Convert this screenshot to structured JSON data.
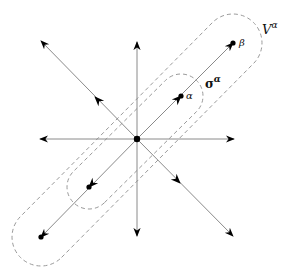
{
  "diagram": {
    "colors": {
      "axis": "#8a8a8a",
      "arrowhead": "#000000",
      "dashed": "#9a9a9a",
      "point": "#000000",
      "text": "#111111"
    },
    "center": {
      "x": 137,
      "y": 139
    },
    "rays": [
      {
        "name": "ray-up",
        "tip": {
          "x": 137,
          "y": 42
        },
        "mid_arrow": false
      },
      {
        "name": "ray-down",
        "tip": {
          "x": 137,
          "y": 236
        },
        "mid_arrow": false
      },
      {
        "name": "ray-left",
        "tip": {
          "x": 40,
          "y": 139
        },
        "mid_arrow": false
      },
      {
        "name": "ray-right",
        "tip": {
          "x": 234,
          "y": 139
        },
        "mid_arrow": false
      },
      {
        "name": "ray-up-left",
        "tip": {
          "x": 41,
          "y": 41
        },
        "mid": {
          "x": 95,
          "y": 97
        },
        "mid_arrow": true
      },
      {
        "name": "ray-down-right",
        "tip": {
          "x": 233,
          "y": 236
        },
        "mid": {
          "x": 180,
          "y": 183
        },
        "mid_arrow": true
      },
      {
        "name": "ray-up-right",
        "tip": {
          "x": 233,
          "y": 43
        },
        "mid": {
          "x": 181,
          "y": 96
        },
        "mid_arrow": true
      },
      {
        "name": "ray-down-left",
        "tip": {
          "x": 41,
          "y": 237
        },
        "mid": {
          "x": 89,
          "y": 187
        },
        "mid_arrow": true
      }
    ],
    "points": [
      {
        "name": "origin",
        "x": 137,
        "y": 139
      },
      {
        "name": "alpha",
        "x": 181,
        "y": 96
      },
      {
        "name": "beta",
        "x": 233,
        "y": 43
      },
      {
        "name": "neg-alpha",
        "x": 89,
        "y": 187
      },
      {
        "name": "neg-beta",
        "x": 41,
        "y": 237
      }
    ],
    "labels": {
      "alpha": {
        "base": "α",
        "x": 186,
        "y": 99
      },
      "beta": {
        "base": "β",
        "x": 239,
        "y": 46
      },
      "sigma": {
        "base": "σ",
        "sup": "α",
        "x": 205,
        "y": 88
      },
      "V": {
        "base": "V",
        "sup": "α",
        "x": 262,
        "y": 34
      }
    },
    "neighborhoods": [
      {
        "name": "V-alpha-region",
        "from": {
          "x": 41,
          "y": 237
        },
        "to": {
          "x": 233,
          "y": 43
        },
        "radius": 29
      },
      {
        "name": "sigma-alpha-region",
        "from": {
          "x": 89,
          "y": 187
        },
        "to": {
          "x": 181,
          "y": 96
        },
        "radius": 22
      }
    ]
  }
}
